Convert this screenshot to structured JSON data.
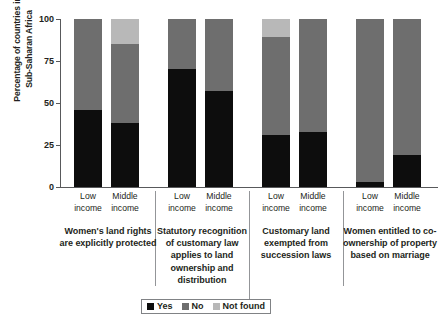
{
  "chart_data": {
    "type": "bar",
    "subtype": "stacked-bar-100pct",
    "title": "",
    "xlabel": "",
    "ylabel": "Percentage of countries in\nSub-Saharan Africa",
    "ylim": [
      0,
      100
    ],
    "yticks": [
      0,
      25,
      50,
      75,
      100
    ],
    "ytick_labels": [
      "0",
      "25",
      "50",
      "75",
      "100"
    ],
    "grid": false,
    "legend_position": "bottom",
    "legend": [
      "Yes",
      "No",
      "Not found"
    ],
    "colors": {
      "yes": "#0d0d0d",
      "no": "#6e6e6e",
      "not_found": "#b8b8b8",
      "axis": "#58595b",
      "separator": "#939598",
      "text": "#231f20",
      "background": "#ffffff"
    },
    "categories": [
      "Low income",
      "Middle income",
      "Low income",
      "Middle income",
      "Low income",
      "Middle income",
      "Low income",
      "Middle income"
    ],
    "series": [
      {
        "name": "Yes",
        "values": [
          46,
          38,
          70,
          57,
          31,
          33,
          3,
          19
        ]
      },
      {
        "name": "No",
        "values": [
          54,
          47,
          30,
          43,
          58,
          67,
          97,
          81
        ]
      },
      {
        "name": "Not found",
        "values": [
          0,
          15,
          0,
          0,
          11,
          0,
          0,
          0
        ]
      }
    ],
    "groups": [
      {
        "label": "Women's land\nrights are explicitly\nprotected",
        "bars": [
          {
            "tick": "Low\nincome",
            "yes": 46,
            "no": 54,
            "not_found": 0
          },
          {
            "tick": "Middle\nincome",
            "yes": 38,
            "no": 47,
            "not_found": 15
          }
        ]
      },
      {
        "label": "Statutory recognition\nof customary law\napplies to land\nownership and\ndistribution",
        "bars": [
          {
            "tick": "Low\nincome",
            "yes": 70,
            "no": 30,
            "not_found": 0
          },
          {
            "tick": "Middle\nincome",
            "yes": 57,
            "no": 43,
            "not_found": 0
          }
        ]
      },
      {
        "label": "Customary land\nexempted from\nsuccession laws",
        "bars": [
          {
            "tick": "Low\nincome",
            "yes": 31,
            "no": 58,
            "not_found": 11
          },
          {
            "tick": "Middle\nincome",
            "yes": 33,
            "no": 67,
            "not_found": 0
          }
        ]
      },
      {
        "label": "Women entitled to\nco-ownership of\nproperty based on\nmarriage",
        "bars": [
          {
            "tick": "Low\nincome",
            "yes": 3,
            "no": 97,
            "not_found": 0
          },
          {
            "tick": "Middle\nincome",
            "yes": 19,
            "no": 81,
            "not_found": 0
          }
        ]
      }
    ]
  },
  "yaxis": {
    "label": "Percentage of countries in\nSub-Saharan Africa",
    "ticks": [
      "100",
      "75",
      "50",
      "25",
      "0"
    ]
  },
  "legend": {
    "items": [
      {
        "label": "Yes",
        "color": "#0d0d0d"
      },
      {
        "label": "No",
        "color": "#6e6e6e"
      },
      {
        "label": "Not found",
        "color": "#b8b8b8"
      }
    ]
  }
}
